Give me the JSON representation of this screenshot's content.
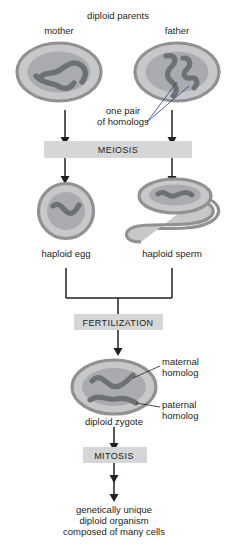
{
  "diagram": {
    "labels": {
      "diploid_parents": "diploid parents",
      "mother": "mother",
      "father": "father",
      "one_pair": "one pair",
      "of_homologs": "of homologs",
      "haploid_egg": "haploid egg",
      "haploid_sperm": "haploid sperm",
      "maternal": "maternal",
      "maternal_homolog": "homolog",
      "paternal": "paternal",
      "paternal_homolog": "homolog",
      "diploid_zygote": "diploid zygote",
      "outcome_line1": "genetically unique",
      "outcome_line2": "diploid organism",
      "outcome_line3": "composed of many cells"
    },
    "process_bars": [
      {
        "name": "meiosis",
        "label": "MEIOSIS"
      },
      {
        "name": "fertilization",
        "label": "FERTILIZATION"
      },
      {
        "name": "mitosis",
        "label": "MITOSIS"
      }
    ],
    "colors": {
      "background": "#ffffff",
      "text": "#231f20",
      "cell_membrane": "#8f9193",
      "cell_cytoplasm": "#c6c8ca",
      "nucleus": "#a9abae",
      "chromosome": "#6e7173",
      "bar_fill": "#d4d6d8",
      "arrow": "#231f20"
    },
    "cells": [
      {
        "name": "mother-cell",
        "type": "oval",
        "chromosomes": 2,
        "ploidy": "diploid"
      },
      {
        "name": "father-cell",
        "type": "oval",
        "chromosomes": 2,
        "ploidy": "diploid"
      },
      {
        "name": "egg-cell",
        "type": "circle",
        "chromosomes": 1,
        "ploidy": "haploid"
      },
      {
        "name": "sperm-cell",
        "type": "tailed",
        "chromosomes": 1,
        "ploidy": "haploid"
      },
      {
        "name": "zygote-cell",
        "type": "oval",
        "chromosomes": 2,
        "ploidy": "diploid"
      }
    ]
  }
}
